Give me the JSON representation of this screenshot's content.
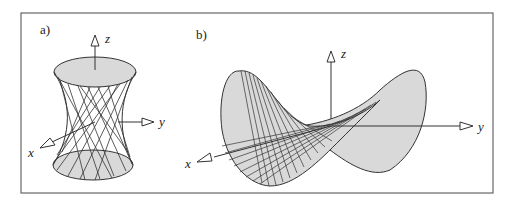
{
  "figure": {
    "panels": [
      {
        "id": "a",
        "label": "a)",
        "surface": "hyperboloid of one sheet (ruled surface)",
        "axes": {
          "x": "x",
          "y": "y",
          "z": "z"
        }
      },
      {
        "id": "b",
        "label": "b)",
        "surface": "hyperbolic paraboloid (saddle, ruled surface)",
        "axes": {
          "x": "x",
          "y": "y",
          "z": "z"
        }
      }
    ],
    "colors": {
      "fill": "#d9d9d9",
      "stroke": "#333333",
      "frame": "#666666"
    }
  }
}
